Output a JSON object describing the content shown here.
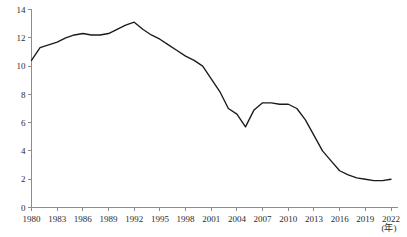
{
  "chart_data": {
    "type": "line",
    "title": "",
    "subtitle": "",
    "xlabel": "(年)",
    "ylabel": "",
    "xlim": [
      1980,
      2022
    ],
    "ylim": [
      0,
      14
    ],
    "grid": false,
    "legend": null,
    "legend_position": "none",
    "x_ticks": [
      1980,
      1983,
      1986,
      1989,
      1992,
      1995,
      1998,
      2001,
      2004,
      2007,
      2010,
      2013,
      2016,
      2019,
      2022
    ],
    "x_tick_labels": [
      "1980",
      "1983",
      "1986",
      "1989",
      "1992",
      "1995",
      "1998",
      "2001",
      "2004",
      "2007",
      "2010",
      "2013",
      "2016",
      "2019",
      "2022"
    ],
    "y_ticks": [
      0,
      2,
      4,
      6,
      8,
      10,
      12,
      14
    ],
    "y_tick_labels": [
      "0",
      "2",
      "4",
      "6",
      "8",
      "10",
      "12",
      "14"
    ],
    "series": [
      {
        "name": "series-1",
        "color": "#1a1a1a",
        "x": [
          1980,
          1981,
          1982,
          1983,
          1984,
          1985,
          1986,
          1987,
          1988,
          1989,
          1990,
          1991,
          1992,
          1993,
          1994,
          1995,
          1996,
          1997,
          1998,
          1999,
          2000,
          2001,
          2002,
          2003,
          2004,
          2005,
          2006,
          2007,
          2008,
          2009,
          2010,
          2011,
          2012,
          2013,
          2014,
          2015,
          2016,
          2017,
          2018,
          2019,
          2020,
          2021,
          2022
        ],
        "values": [
          10.4,
          11.3,
          11.5,
          11.7,
          12.0,
          12.2,
          12.3,
          12.2,
          12.2,
          12.3,
          12.6,
          12.9,
          13.1,
          12.6,
          12.2,
          11.9,
          11.5,
          11.1,
          10.7,
          10.4,
          10.0,
          9.1,
          8.2,
          7.0,
          6.6,
          5.7,
          6.9,
          7.4,
          7.4,
          7.3,
          7.3,
          7.0,
          6.2,
          5.1,
          4.0,
          3.3,
          2.6,
          2.3,
          2.1,
          2.0,
          1.9,
          1.9,
          2.0
        ]
      }
    ]
  },
  "axis": {
    "unit_note": "(年)"
  }
}
